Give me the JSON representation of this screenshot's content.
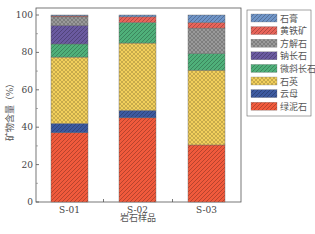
{
  "chart_data": {
    "type": "bar",
    "stacked": true,
    "title": "",
    "xlabel": "岩石样品",
    "ylabel": "矿物含量（%）",
    "ylim": [
      0,
      100
    ],
    "yticks": [
      0,
      20,
      40,
      60,
      80,
      100
    ],
    "grid": false,
    "legend_position": "right-outside-top",
    "categories": [
      "S-01",
      "S-02",
      "S-03"
    ],
    "series": [
      {
        "name": "绿泥石",
        "color": "#f05a3c",
        "pattern": "diag-stripe",
        "values": [
          37,
          45,
          30.5
        ]
      },
      {
        "name": "云母",
        "color": "#3d5aa0",
        "pattern": "diag-stripe",
        "values": [
          5,
          4,
          0
        ]
      },
      {
        "name": "石英",
        "color": "#f2cf5c",
        "pattern": "crosshatch",
        "values": [
          35.5,
          36,
          40
        ]
      },
      {
        "name": "微斜长石",
        "color": "#4fb07a",
        "pattern": "diag-stripe",
        "values": [
          7,
          11,
          9
        ]
      },
      {
        "name": "钠长石",
        "color": "#6a5aa0",
        "pattern": "diag-stripe",
        "values": [
          10,
          0,
          0
        ]
      },
      {
        "name": "方解石",
        "color": "#9a9a9a",
        "pattern": "crosshatch",
        "values": [
          4.5,
          0,
          13.5
        ]
      },
      {
        "name": "黄铁矿",
        "color": "#e8645a",
        "pattern": "diag-stripe",
        "values": [
          0.5,
          3,
          3
        ]
      },
      {
        "name": "石膏",
        "color": "#6f95c8",
        "pattern": "diag-stripe",
        "values": [
          0.5,
          1,
          4
        ]
      }
    ],
    "legend_order": [
      "石膏",
      "黄铁矿",
      "方解石",
      "钠长石",
      "微斜长石",
      "石英",
      "云母",
      "绿泥石"
    ]
  }
}
